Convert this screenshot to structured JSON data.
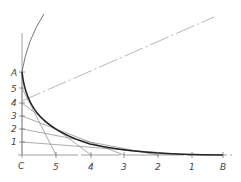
{
  "diagram": {
    "axis_labels": {
      "origin": "C",
      "top": "A",
      "right": "B"
    },
    "vertical_points": [
      {
        "label": "5",
        "y": 88
      },
      {
        "label": "4",
        "y": 103
      },
      {
        "label": "3",
        "y": 116
      },
      {
        "label": "2",
        "y": 129
      },
      {
        "label": "1",
        "y": 142
      }
    ],
    "horizontal_points": [
      {
        "label": "5",
        "x": 56
      },
      {
        "label": "4",
        "x": 91
      },
      {
        "label": "3",
        "x": 124
      },
      {
        "label": "2",
        "x": 158
      },
      {
        "label": "1",
        "x": 192
      }
    ],
    "colors": {
      "curve": "#222222",
      "construction": "#888888",
      "labels": "#444444"
    }
  }
}
